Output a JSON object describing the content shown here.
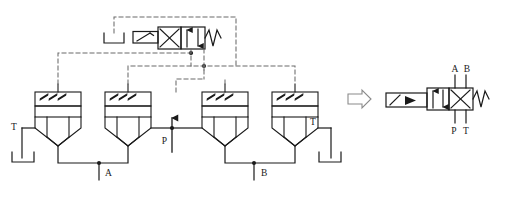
{
  "diagram": {
    "line_color": "#1a1a1a",
    "pilot_line_color": "#6b6b6b",
    "background": "#ffffff"
  },
  "pilot_valve": {
    "name": "pilot directional control valve",
    "spool_left_symbol": "X",
    "spool_right_symbol": "arrows-up-down",
    "spring_symbol": "W",
    "actuator_symbol": "lever",
    "solenoid_symbol": "bracket"
  },
  "main_valve": {
    "name": "main directional control valve",
    "ports_top": [
      "A",
      "B"
    ],
    "ports_bottom": [
      "P",
      "T"
    ],
    "port_a": "A",
    "port_b": "B",
    "port_p": "P",
    "port_t": "T",
    "spring_symbol": "W",
    "actuator_symbol": "lever-with-arrow",
    "pointer_symbol": "block-arrow-right"
  },
  "cartridge_valves": [
    {
      "id": "cv1",
      "name": "cartridge-valve-1"
    },
    {
      "id": "cv2",
      "name": "cartridge-valve-2"
    },
    {
      "id": "cv3",
      "name": "cartridge-valve-3"
    },
    {
      "id": "cv4",
      "name": "cartridge-valve-4"
    }
  ],
  "circuit_labels": {
    "tank_left": "T",
    "tank_right": "T",
    "pressure": "P",
    "port_a": "A",
    "port_b": "B"
  }
}
